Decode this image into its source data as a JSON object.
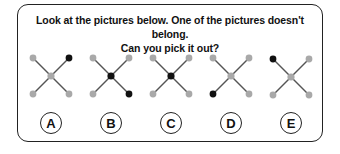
{
  "question": {
    "line1": "Look at the pictures below. One of the pictures doesn't belong.",
    "line2": "Can you pick it out?"
  },
  "colors": {
    "gray_dot": "#a9a9a9",
    "black_dot": "#111111",
    "line": "#555555",
    "border": "#222222"
  },
  "figures": [
    {
      "label": "A",
      "center": "gray",
      "top_left": "gray",
      "top_right": "black",
      "bottom_left": "gray",
      "bottom_right": "gray"
    },
    {
      "label": "B",
      "center": "black",
      "top_left": "gray",
      "top_right": "gray",
      "bottom_left": "gray",
      "bottom_right": "black"
    },
    {
      "label": "C",
      "center": "black",
      "top_left": "gray",
      "top_right": "gray",
      "bottom_left": "gray",
      "bottom_right": "gray"
    },
    {
      "label": "D",
      "center": "gray",
      "top_left": "gray",
      "top_right": "gray",
      "bottom_left": "black",
      "bottom_right": "gray"
    },
    {
      "label": "E",
      "center": "gray",
      "top_left": "black",
      "top_right": "gray",
      "bottom_left": "gray",
      "bottom_right": "gray"
    }
  ],
  "options": [
    "A",
    "B",
    "C",
    "D",
    "E"
  ]
}
